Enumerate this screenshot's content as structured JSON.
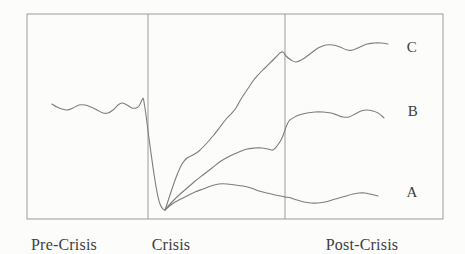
{
  "colors": {
    "background": "#fcfcfb",
    "frame": "#9b9b9b",
    "curve": "#7d7d7d",
    "text": "#3d3d3d"
  },
  "frame": {
    "x": 27,
    "y": 14,
    "width": 416,
    "height": 205,
    "dividers_x": [
      148,
      285
    ]
  },
  "phases": [
    {
      "label": "Pre-Crisis",
      "center_x": 64
    },
    {
      "label": "Crisis",
      "center_x": 171
    },
    {
      "label": "Post-Crisis",
      "center_x": 362
    }
  ],
  "curve_labels": [
    {
      "label": "C",
      "x": 412,
      "y": 47
    },
    {
      "label": "B",
      "x": 413,
      "y": 111
    },
    {
      "label": "A",
      "x": 412,
      "y": 192
    }
  ],
  "curves": {
    "pre_crisis_baseline": [
      [
        52,
        104
      ],
      [
        57,
        107
      ],
      [
        62,
        109
      ],
      [
        67,
        110
      ],
      [
        73,
        108
      ],
      [
        79,
        105
      ],
      [
        85,
        105
      ],
      [
        91,
        107
      ],
      [
        97,
        110
      ],
      [
        103,
        113
      ],
      [
        108,
        113
      ],
      [
        113,
        110
      ],
      [
        118,
        105
      ],
      [
        122,
        103
      ],
      [
        127,
        105
      ],
      [
        132,
        108
      ],
      [
        136,
        108
      ],
      [
        139,
        106
      ],
      [
        141,
        102
      ],
      [
        143,
        98
      ],
      [
        144,
        102
      ],
      [
        146,
        115
      ],
      [
        148,
        131
      ],
      [
        151,
        153
      ],
      [
        154,
        174
      ],
      [
        157,
        192
      ],
      [
        160,
        204
      ],
      [
        163,
        209
      ],
      [
        165,
        210
      ]
    ],
    "recovery_c": [
      [
        165,
        210
      ],
      [
        169,
        198
      ],
      [
        173,
        186
      ],
      [
        177,
        175
      ],
      [
        182,
        164
      ],
      [
        187,
        158
      ],
      [
        193,
        155
      ],
      [
        199,
        151
      ],
      [
        206,
        144
      ],
      [
        213,
        136
      ],
      [
        220,
        127
      ],
      [
        227,
        118
      ],
      [
        231,
        114
      ],
      [
        236,
        108
      ],
      [
        241,
        99
      ],
      [
        247,
        90
      ],
      [
        253,
        81
      ],
      [
        259,
        74
      ],
      [
        265,
        68
      ],
      [
        271,
        62
      ],
      [
        276,
        57
      ],
      [
        280,
        53
      ],
      [
        283,
        52
      ],
      [
        286,
        56
      ],
      [
        291,
        60
      ],
      [
        296,
        62
      ],
      [
        303,
        59
      ],
      [
        310,
        54
      ],
      [
        318,
        48
      ],
      [
        326,
        45
      ],
      [
        333,
        45
      ],
      [
        340,
        47
      ],
      [
        347,
        50
      ],
      [
        353,
        50
      ],
      [
        360,
        47
      ],
      [
        367,
        44
      ],
      [
        374,
        43
      ],
      [
        381,
        43
      ],
      [
        388,
        44
      ]
    ],
    "recovery_b": [
      [
        165,
        210
      ],
      [
        171,
        203
      ],
      [
        178,
        196
      ],
      [
        186,
        189
      ],
      [
        194,
        182
      ],
      [
        203,
        175
      ],
      [
        212,
        168
      ],
      [
        221,
        161
      ],
      [
        230,
        156
      ],
      [
        239,
        152
      ],
      [
        247,
        149
      ],
      [
        255,
        148
      ],
      [
        262,
        148
      ],
      [
        268,
        149
      ],
      [
        273,
        150
      ],
      [
        277,
        146
      ],
      [
        281,
        140
      ],
      [
        284,
        133
      ],
      [
        286,
        127
      ],
      [
        289,
        121
      ],
      [
        293,
        118
      ],
      [
        299,
        115
      ],
      [
        307,
        113
      ],
      [
        315,
        112
      ],
      [
        323,
        112
      ],
      [
        331,
        113
      ],
      [
        337,
        115
      ],
      [
        343,
        117
      ],
      [
        349,
        117
      ],
      [
        355,
        114
      ],
      [
        361,
        111
      ],
      [
        367,
        110
      ],
      [
        373,
        111
      ],
      [
        378,
        113
      ],
      [
        382,
        116
      ],
      [
        384,
        118
      ]
    ],
    "recovery_a": [
      [
        165,
        210
      ],
      [
        172,
        204
      ],
      [
        179,
        200
      ],
      [
        187,
        196
      ],
      [
        195,
        192
      ],
      [
        203,
        189
      ],
      [
        211,
        186
      ],
      [
        219,
        184
      ],
      [
        227,
        184
      ],
      [
        235,
        185
      ],
      [
        243,
        186
      ],
      [
        251,
        188
      ],
      [
        259,
        191
      ],
      [
        267,
        193
      ],
      [
        275,
        195
      ],
      [
        281,
        196
      ],
      [
        285,
        197
      ],
      [
        291,
        198
      ],
      [
        297,
        200
      ],
      [
        304,
        202
      ],
      [
        311,
        203
      ],
      [
        318,
        203
      ],
      [
        325,
        202
      ],
      [
        332,
        200
      ],
      [
        339,
        198
      ],
      [
        346,
        196
      ],
      [
        353,
        194
      ],
      [
        359,
        193
      ],
      [
        365,
        193
      ],
      [
        370,
        194
      ],
      [
        374,
        195
      ],
      [
        378,
        196
      ]
    ]
  }
}
